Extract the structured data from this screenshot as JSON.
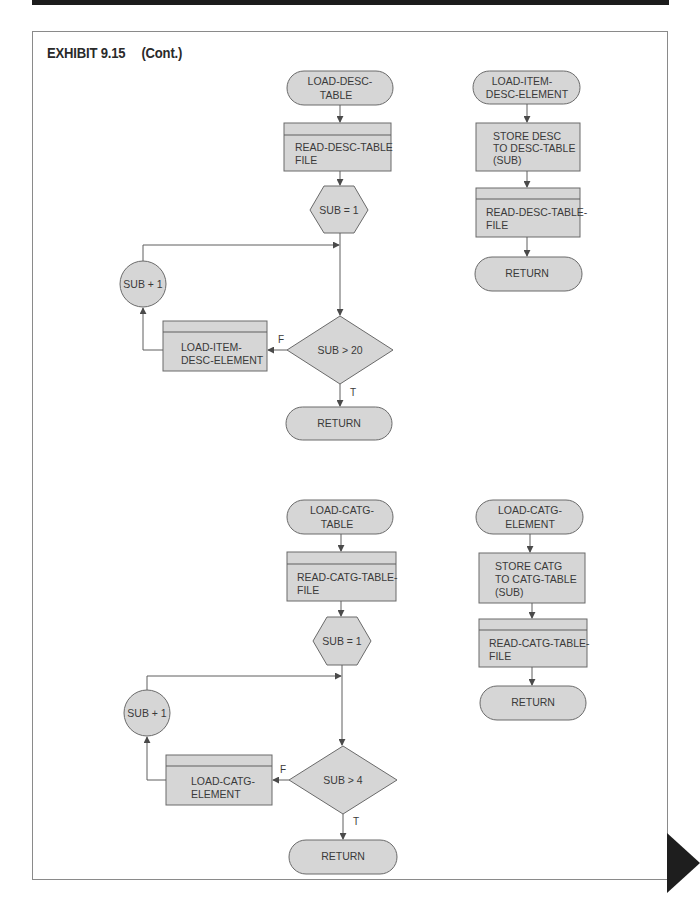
{
  "header": {
    "exhibit_label": "EXHIBIT 9.15",
    "continuation": "(Cont.)"
  },
  "diagrams": {
    "desc_table": {
      "main": {
        "start": [
          "LOAD-DESC-",
          "TABLE"
        ],
        "read": [
          "READ-DESC-TABLE",
          "FILE"
        ],
        "init": "SUB = 1",
        "increment": "SUB + 1",
        "condition": "SUB > 20",
        "call": [
          "LOAD-ITEM-",
          "DESC-ELEMENT"
        ],
        "false_label": "F",
        "true_label": "T",
        "end": "RETURN"
      },
      "element": {
        "start": [
          "LOAD-ITEM-",
          "DESC-ELEMENT"
        ],
        "store": [
          "STORE DESC",
          "TO DESC-TABLE",
          "(SUB)"
        ],
        "read": [
          "READ-DESC-TABLE-",
          "FILE"
        ],
        "end": "RETURN"
      }
    },
    "catg_table": {
      "main": {
        "start": [
          "LOAD-CATG-",
          "TABLE"
        ],
        "read": [
          "READ-CATG-TABLE-",
          "FILE"
        ],
        "init": "SUB = 1",
        "increment": "SUB + 1",
        "condition": "SUB > 4",
        "call": [
          "LOAD-CATG-",
          "ELEMENT"
        ],
        "false_label": "F",
        "true_label": "T",
        "end": "RETURN"
      },
      "element": {
        "start": [
          "LOAD-CATG-",
          "ELEMENT"
        ],
        "store": [
          "STORE CATG",
          "TO CATG-TABLE",
          "(SUB)"
        ],
        "read": [
          "READ-CATG-TABLE-",
          "FILE"
        ],
        "end": "RETURN"
      }
    }
  },
  "colors": {
    "shape_fill": "#d6d6d6",
    "shape_stroke": "#6a6a6a",
    "topbar": "#1c1c1c",
    "next_page_marker": "#1e1e1e"
  }
}
